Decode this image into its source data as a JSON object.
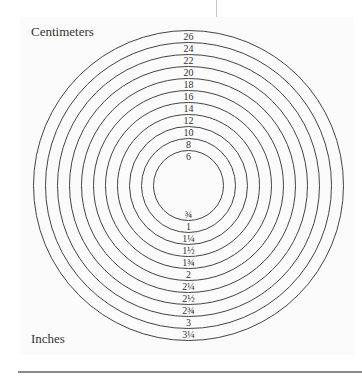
{
  "diagram": {
    "title_top": "Centimeters",
    "title_bottom": "Inches",
    "center": {
      "x": 188.5,
      "y": 185.5
    },
    "inner_radius": 35,
    "ring_step": 12,
    "stroke_color": "#444444",
    "rings": [
      {
        "cm": "6",
        "inches": "¾"
      },
      {
        "cm": "8",
        "inches": "1"
      },
      {
        "cm": "10",
        "inches": "1¼"
      },
      {
        "cm": "12",
        "inches": "1½"
      },
      {
        "cm": "14",
        "inches": "1¾"
      },
      {
        "cm": "16",
        "inches": "2"
      },
      {
        "cm": "18",
        "inches": "2¼"
      },
      {
        "cm": "20",
        "inches": "2½"
      },
      {
        "cm": "22",
        "inches": "2¾"
      },
      {
        "cm": "24",
        "inches": "3"
      },
      {
        "cm": "26",
        "inches": "3¼"
      }
    ]
  }
}
